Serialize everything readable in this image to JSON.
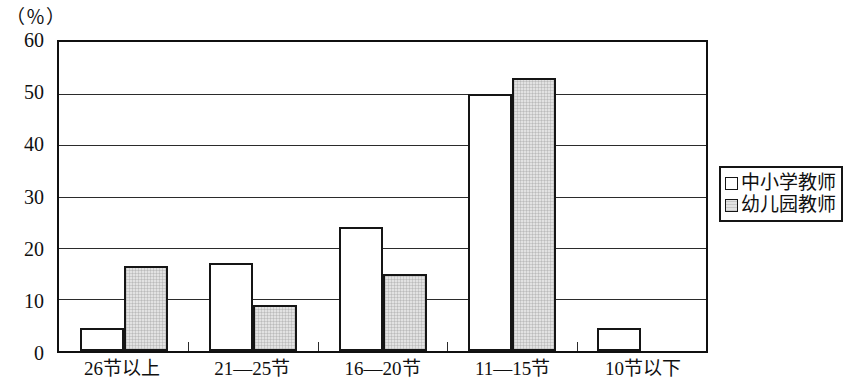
{
  "chart_data": {
    "type": "bar",
    "title": "",
    "subtitle": "",
    "xlabel": "",
    "ylabel": "",
    "unit_label": "（％）",
    "categories": [
      "26节以上",
      "21—25节",
      "16—20节",
      "11—15节",
      "10节以下"
    ],
    "series": [
      {
        "name": "中小学教师",
        "swatch": "white-square",
        "color": "#ffffff",
        "values": [
          4.5,
          17,
          24,
          50,
          4.5
        ]
      },
      {
        "name": "幼儿园教师",
        "swatch": "gray-square",
        "color": "#e2e2e2",
        "values": [
          16.5,
          9,
          15,
          53,
          0
        ]
      }
    ],
    "ylim": [
      0,
      60
    ],
    "yticks": [
      "0",
      "10",
      "20",
      "30",
      "40",
      "50",
      "60"
    ],
    "grid": "horizontal",
    "legend_position": "right"
  },
  "legend": {
    "items": [
      {
        "label": "中小学教师"
      },
      {
        "label": "幼儿园教师"
      }
    ]
  }
}
